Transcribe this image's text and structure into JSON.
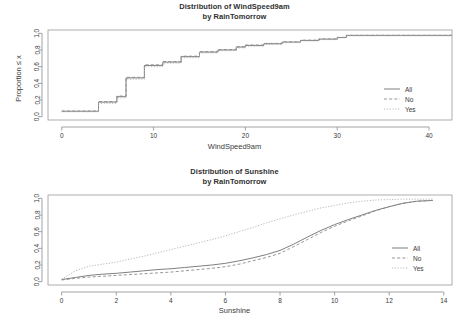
{
  "panels": [
    {
      "id": "wind",
      "title_line1": "Distribution of WindSpeed9am",
      "title_line2": "by RainTomorrow",
      "xlabel": "WindSpeed9am",
      "ylabel": "Proportion ≤ x",
      "legend": [
        {
          "label": "All",
          "style": "solid"
        },
        {
          "label": "No",
          "style": "dashed"
        },
        {
          "label": "Yes",
          "style": "dotted"
        }
      ],
      "xticks": [
        "0",
        "10",
        "20",
        "30",
        "40"
      ],
      "yticks": [
        "0.0",
        "0.2",
        "0.4",
        "0.6",
        "0.8",
        "1.0"
      ]
    },
    {
      "id": "sun",
      "title_line1": "Distribution of Sunshine",
      "title_line2": "by RainTomorrow",
      "xlabel": "Sunshine",
      "ylabel": "Proportion ≤ x",
      "legend": [
        {
          "label": "All",
          "style": "solid"
        },
        {
          "label": "No",
          "style": "dashed"
        },
        {
          "label": "Yes",
          "style": "dotted"
        }
      ],
      "xticks": [
        "0",
        "2",
        "4",
        "6",
        "8",
        "10",
        "12",
        "14"
      ],
      "yticks": [
        "0.0",
        "0.2",
        "0.4",
        "0.6",
        "0.8",
        "1.0"
      ]
    }
  ],
  "chart_data": [
    {
      "type": "line",
      "subtype": "ecdf-step",
      "title": "Distribution of WindSpeed9am by RainTomorrow",
      "xlabel": "WindSpeed9am",
      "ylabel": "Proportion ≤ x",
      "xlim": [
        -1.5,
        42.5
      ],
      "ylim": [
        -0.04,
        1.04
      ],
      "xticks": [
        0,
        10,
        20,
        30,
        40
      ],
      "yticks": [
        0.0,
        0.2,
        0.4,
        0.6,
        0.8,
        1.0
      ],
      "grid": false,
      "legend_position": "right-middle",
      "legend": [
        "All",
        "No",
        "Yes"
      ],
      "series": [
        {
          "name": "All",
          "style": "solid",
          "x": [
            0,
            2,
            4,
            6,
            7,
            9,
            11,
            13,
            15,
            17,
            19,
            20,
            22,
            24,
            26,
            28,
            30,
            31,
            33,
            35,
            37,
            39,
            41
          ],
          "y": [
            0.065,
            0.065,
            0.175,
            0.24,
            0.465,
            0.615,
            0.655,
            0.72,
            0.775,
            0.8,
            0.835,
            0.855,
            0.875,
            0.895,
            0.915,
            0.93,
            0.95,
            0.975,
            0.975,
            0.975,
            0.975,
            0.975,
            0.975
          ]
        },
        {
          "name": "No",
          "style": "dashed",
          "x": [
            0,
            2,
            4,
            6,
            7,
            9,
            11,
            13,
            15,
            17,
            19,
            20,
            22,
            24,
            26,
            28,
            30,
            31,
            33,
            35,
            37,
            39,
            41
          ],
          "y": [
            0.068,
            0.068,
            0.182,
            0.248,
            0.472,
            0.622,
            0.662,
            0.726,
            0.78,
            0.806,
            0.84,
            0.86,
            0.879,
            0.898,
            0.918,
            0.933,
            0.952,
            0.977,
            0.977,
            0.977,
            0.977,
            0.977,
            0.977
          ]
        },
        {
          "name": "Yes",
          "style": "dotted",
          "x": [
            0,
            2,
            4,
            6,
            7,
            9,
            11,
            13,
            15,
            17,
            19,
            20,
            22,
            24,
            26,
            28,
            30,
            31,
            33,
            35,
            37,
            39,
            41
          ],
          "y": [
            0.058,
            0.058,
            0.16,
            0.225,
            0.45,
            0.6,
            0.642,
            0.708,
            0.765,
            0.792,
            0.826,
            0.846,
            0.867,
            0.888,
            0.908,
            0.925,
            0.945,
            0.97,
            0.97,
            0.97,
            0.97,
            0.97,
            0.97
          ]
        }
      ]
    },
    {
      "type": "line",
      "subtype": "ecdf",
      "title": "Distribution of Sunshine by RainTomorrow",
      "xlabel": "Sunshine",
      "ylabel": "Proportion ≤ x",
      "xlim": [
        -0.5,
        14.3
      ],
      "ylim": [
        -0.04,
        1.04
      ],
      "xticks": [
        0,
        2,
        4,
        6,
        8,
        10,
        12,
        14
      ],
      "yticks": [
        0.0,
        0.2,
        0.4,
        0.6,
        0.8,
        1.0
      ],
      "grid": false,
      "legend_position": "right-middle",
      "legend": [
        "All",
        "No",
        "Yes"
      ],
      "series": [
        {
          "name": "All",
          "style": "solid",
          "x": [
            0,
            0.5,
            1,
            1.5,
            2,
            2.5,
            3,
            3.5,
            4,
            4.5,
            5,
            5.5,
            6,
            6.5,
            7,
            7.5,
            8,
            8.5,
            9,
            9.5,
            10,
            10.5,
            11,
            11.5,
            12,
            12.5,
            13,
            13.6
          ],
          "y": [
            0.025,
            0.05,
            0.075,
            0.09,
            0.1,
            0.115,
            0.13,
            0.145,
            0.155,
            0.17,
            0.185,
            0.2,
            0.22,
            0.25,
            0.285,
            0.325,
            0.375,
            0.45,
            0.535,
            0.615,
            0.685,
            0.745,
            0.8,
            0.855,
            0.9,
            0.94,
            0.965,
            0.975
          ]
        },
        {
          "name": "No",
          "style": "dashed",
          "x": [
            0,
            0.5,
            1,
            1.5,
            2,
            2.5,
            3,
            3.5,
            4,
            4.5,
            5,
            5.5,
            6,
            6.5,
            7,
            7.5,
            8,
            8.5,
            9,
            9.5,
            10,
            10.5,
            11,
            11.5,
            12,
            12.5,
            13,
            13.6
          ],
          "y": [
            0.02,
            0.04,
            0.055,
            0.065,
            0.075,
            0.085,
            0.095,
            0.105,
            0.115,
            0.13,
            0.145,
            0.16,
            0.18,
            0.21,
            0.25,
            0.29,
            0.34,
            0.42,
            0.505,
            0.59,
            0.665,
            0.73,
            0.79,
            0.85,
            0.9,
            0.94,
            0.965,
            0.975
          ]
        },
        {
          "name": "Yes",
          "style": "dotted",
          "x": [
            0,
            0.5,
            1,
            1.5,
            2,
            2.5,
            3,
            3.5,
            4,
            4.5,
            5,
            5.5,
            6,
            6.5,
            7,
            7.5,
            8,
            8.5,
            9,
            9.5,
            10,
            10.5,
            11,
            11.5,
            12,
            12.5,
            13,
            13.6
          ],
          "y": [
            0.03,
            0.13,
            0.185,
            0.21,
            0.235,
            0.27,
            0.305,
            0.345,
            0.385,
            0.425,
            0.465,
            0.505,
            0.55,
            0.6,
            0.65,
            0.705,
            0.755,
            0.8,
            0.845,
            0.885,
            0.915,
            0.945,
            0.965,
            0.98,
            0.985,
            0.99,
            0.99,
            0.99
          ]
        }
      ]
    }
  ]
}
